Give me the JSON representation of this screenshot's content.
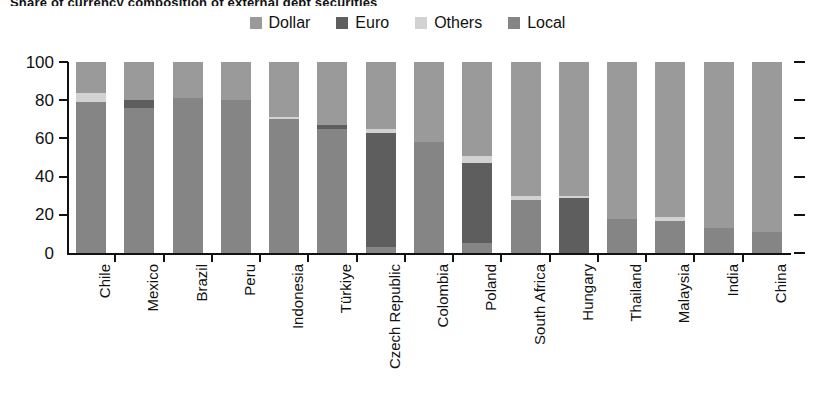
{
  "title": "Share of currency composition of external debt securities",
  "legend": {
    "position": "top-center",
    "items": [
      {
        "label": "Dollar",
        "color": "#9a9a9a",
        "key": "dollar"
      },
      {
        "label": "Euro",
        "color": "#5e5e5e",
        "key": "euro"
      },
      {
        "label": "Others",
        "color": "#d2d2d2",
        "key": "others"
      },
      {
        "label": "Local",
        "color": "#858585",
        "key": "local"
      }
    ]
  },
  "axis": {
    "y_ticks": [
      "0",
      "20",
      "40",
      "60",
      "80",
      "100"
    ],
    "y_tick_values": [
      0,
      20,
      40,
      60,
      80,
      100
    ],
    "ylim": [
      0,
      100
    ],
    "right_ticks": [
      0,
      20,
      40,
      60,
      80,
      100
    ]
  },
  "chart_data": {
    "type": "bar",
    "subtype": "stacked-100",
    "title": "Share of currency composition of external debt securities",
    "xlabel": "",
    "ylabel": "",
    "ylim": [
      0,
      100
    ],
    "grid": false,
    "legend_position": "top-center",
    "stack_order_bottom_to_top": [
      "Local",
      "Euro",
      "Others",
      "Dollar"
    ],
    "categories": [
      "Chile",
      "Mexico",
      "Brazil",
      "Peru",
      "Indonesia",
      "Türkiye",
      "Czech Republic",
      "Colombia",
      "Poland",
      "South Africa",
      "Hungary",
      "Thailand",
      "Malaysia",
      "India",
      "China"
    ],
    "series": [
      {
        "name": "Local",
        "color": "#858585",
        "values": [
          79,
          76,
          81,
          80,
          70,
          65,
          3,
          58,
          5,
          28,
          0,
          18,
          17,
          13,
          11
        ]
      },
      {
        "name": "Euro",
        "color": "#5e5e5e",
        "values": [
          0,
          4,
          0,
          0,
          0,
          2,
          60,
          0,
          42,
          0,
          29,
          0,
          0,
          0,
          0
        ]
      },
      {
        "name": "Others",
        "color": "#d2d2d2",
        "values": [
          5,
          0,
          0,
          0,
          1,
          0,
          2,
          0,
          4,
          2,
          1,
          0,
          2,
          0,
          0
        ]
      },
      {
        "name": "Dollar",
        "color": "#9a9a9a",
        "values": [
          16,
          20,
          19,
          20,
          29,
          33,
          35,
          42,
          49,
          70,
          70,
          82,
          81,
          87,
          89
        ]
      }
    ]
  }
}
